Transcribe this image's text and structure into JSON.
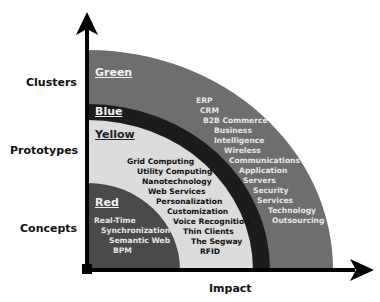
{
  "diagram": {
    "axes": {
      "y_labels": [
        "Clusters",
        "Prototypes",
        "Concepts"
      ],
      "x_label": "Impact"
    },
    "zones": [
      {
        "name": "Green",
        "fill": "#6e6e6e",
        "items": [
          "ERP",
          "CRM",
          "B2B Commerce",
          "Business",
          "Intelligence",
          "Wireless",
          "Communications",
          "Application",
          "Servers",
          "Security",
          "Services",
          "Technology",
          "Outsourcing"
        ]
      },
      {
        "name": "Blue",
        "fill": "#1c1c1c",
        "items": []
      },
      {
        "name": "Yellow",
        "fill": "#dcdcdc",
        "items": [
          "Grid Computing",
          "Utility Computing",
          "Nanotechnology",
          "Web Services",
          "Personalization",
          "Customization",
          "Voice Recognition",
          "Thin Clients",
          "The Segway",
          "RFID"
        ]
      },
      {
        "name": "Red",
        "fill": "#4a4a4a",
        "items": [
          "Real-Time",
          "Synchronization",
          "Semantic Web",
          "BPM"
        ]
      }
    ]
  }
}
